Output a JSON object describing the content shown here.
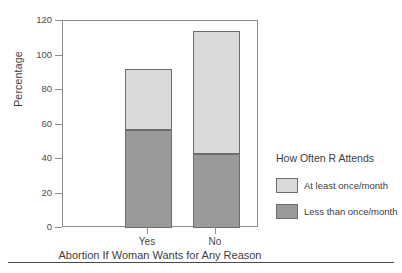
{
  "chart_data": {
    "type": "bar",
    "stacked": true,
    "title": "",
    "xlabel": "Abortion If Woman Wants for Any Reason",
    "ylabel": "Percentage",
    "categories": [
      "Yes",
      "No"
    ],
    "series": [
      {
        "name": "Less than once/month",
        "color": "#9a9a9a",
        "values": [
          57,
          43
        ]
      },
      {
        "name": "At least once/month",
        "color": "#d9d9d9",
        "values": [
          35,
          71
        ]
      }
    ],
    "totals": [
      92,
      114
    ],
    "ylim": [
      0,
      120
    ],
    "yticks": [
      0,
      20,
      40,
      60,
      80,
      100,
      120
    ],
    "ytick_labels": [
      "0",
      "20",
      "40",
      "60",
      "80",
      "100",
      "120"
    ],
    "grid": false,
    "legend_position": "right",
    "legend_title": "How Often R Attends",
    "legend_entries": [
      {
        "label": "At least once/month",
        "color": "#d9d9d9"
      },
      {
        "label": "Less than once/month",
        "color": "#9a9a9a"
      }
    ]
  },
  "colors": {
    "axis": "#8d8d8d",
    "bar_border": "#6d6d6d",
    "text": "#3d3d3d",
    "rule": "#4a4a4a",
    "light_segment": "#d9d9d9",
    "dark_segment": "#9a9a9a"
  }
}
